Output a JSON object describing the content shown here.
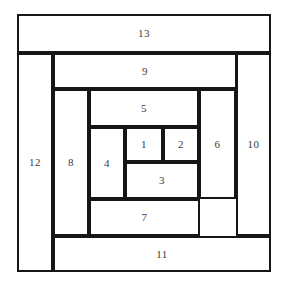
{
  "diagram": {
    "type": "squared-rectangle-spiral",
    "canvas": {
      "width": 283,
      "height": 286,
      "background": "#ffffff"
    },
    "stroke_color": "#161616",
    "label_color": "#1a1a1a",
    "outer_bounds": {
      "x": 17,
      "y": 14,
      "width": 254,
      "height": 258
    },
    "regions": [
      {
        "label": "1",
        "x": 125,
        "y": 127,
        "width": 38,
        "height": 35
      },
      {
        "label": "2",
        "x": 163,
        "y": 127,
        "width": 36,
        "height": 35
      },
      {
        "label": "3",
        "x": 125,
        "y": 162,
        "width": 74,
        "height": 37
      },
      {
        "label": "4",
        "x": 89,
        "y": 127,
        "width": 36,
        "height": 72
      },
      {
        "label": "5",
        "x": 89,
        "y": 89,
        "width": 110,
        "height": 38
      },
      {
        "label": "6",
        "x": 199,
        "y": 89,
        "width": 37,
        "height": 110
      },
      {
        "label": "7",
        "x": 89,
        "y": 199,
        "width": 111,
        "height": 37
      },
      {
        "label": "8",
        "x": 53,
        "y": 89,
        "width": 36,
        "height": 147
      },
      {
        "label": "9",
        "x": 53,
        "y": 53,
        "width": 184,
        "height": 36
      },
      {
        "label": "10",
        "x": 236,
        "y": 53,
        "width": 35,
        "height": 183
      },
      {
        "label": "11",
        "x": 53,
        "y": 236,
        "width": 218,
        "height": 36
      },
      {
        "label": "12",
        "x": 17,
        "y": 53,
        "width": 36,
        "height": 219
      },
      {
        "label": "13",
        "x": 17,
        "y": 14,
        "width": 254,
        "height": 39
      }
    ]
  }
}
